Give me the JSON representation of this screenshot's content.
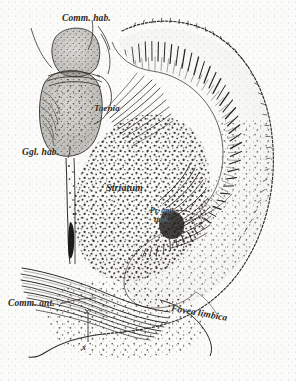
{
  "figure": {
    "type": "anatomical-illustration",
    "medium": "stipple-and-line-engraving",
    "background_color": "#fbfbf9",
    "ink_color": "#2a2724"
  },
  "labels": {
    "comm_hab": "Comm. hab.",
    "taenia": "Taenia",
    "ggl_hab": "Ggl. hab.",
    "striatum": "Striatum",
    "pr_line1": "Pr. ant.",
    "pr_line2": "tual.",
    "comm_ant": "Comm. ant.",
    "fovea_limbica": "Fovea limbica",
    "marker_x": "x"
  },
  "structures": {
    "outer_boundary": "dotted-epithelial-margin",
    "habenular_ganglion": "stippled-oval-body-upper-left",
    "striatum_field": "dense-stippled-cell-field-center",
    "fiber_radiation": "radiating-fiber-bundles-upper-right",
    "commissure_bundles": "sweeping-fiber-bundles-lower-left",
    "stalk": "vertical-tract-descending-from-ganglion"
  }
}
